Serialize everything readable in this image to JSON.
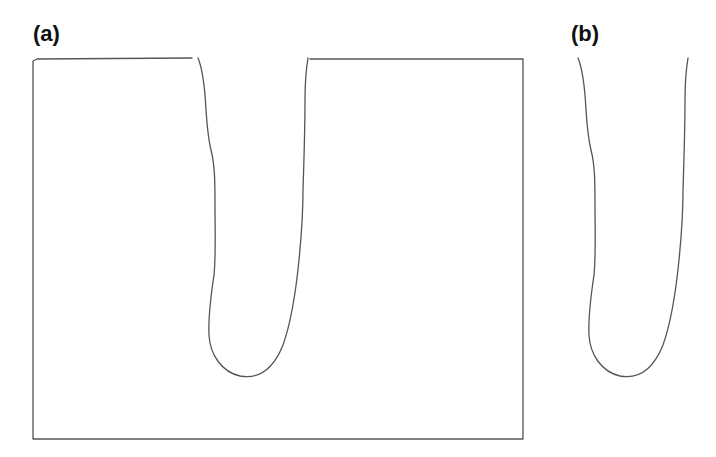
{
  "figure": {
    "panels": [
      {
        "id": "a",
        "label": "(a)",
        "description": "Rectangular block with a deep U-shaped notch cut from the top edge"
      },
      {
        "id": "b",
        "label": "(b)",
        "description": "Isolated U-shaped notch profile"
      }
    ],
    "colors": {
      "line": "#555555",
      "background": "#ffffff",
      "label": "#111111"
    }
  }
}
